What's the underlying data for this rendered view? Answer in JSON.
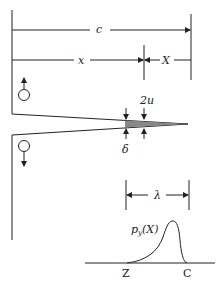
{
  "diagram": {
    "type": "crack-cohesive-zone-schematic",
    "labels": {
      "c": "c",
      "x": "x",
      "X": "X",
      "two_u": "2u",
      "delta": "δ",
      "lambda": "λ",
      "density": "p",
      "density_sub": "y",
      "density_arg": "(X)",
      "Z": "Z",
      "C": "C"
    },
    "colors": {
      "line": "#222222",
      "process_zone": "#888888",
      "background": "#ffffff"
    }
  }
}
